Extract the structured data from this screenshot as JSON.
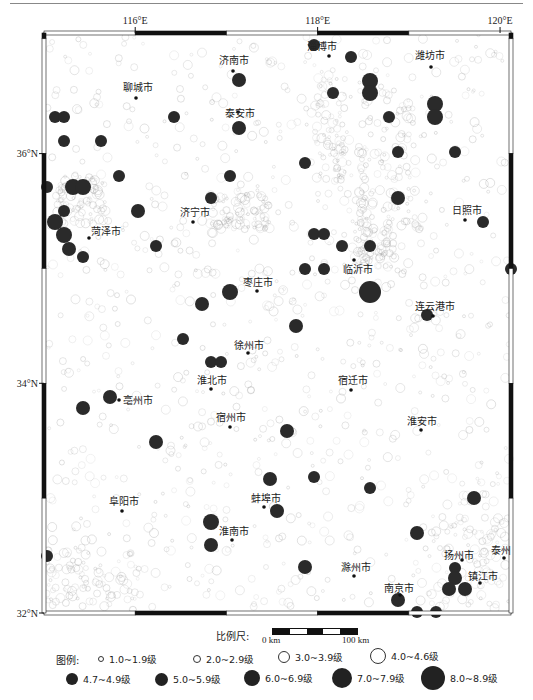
{
  "map": {
    "frame": {
      "left": 44,
      "top": 33,
      "right": 511,
      "bottom": 613
    },
    "lon_range": [
      115.0,
      120.12
    ],
    "lat_range": [
      32.0,
      37.05
    ],
    "lon_ticks": [
      {
        "label": "116°E",
        "value": 116
      },
      {
        "label": "118°E",
        "value": 118
      },
      {
        "label": "120°E",
        "value": 120
      }
    ],
    "lat_ticks": [
      {
        "label": "36°N",
        "value": 36
      },
      {
        "label": "34°N",
        "value": 34
      },
      {
        "label": "32°N",
        "value": 32
      }
    ],
    "cities": [
      {
        "name": "淄博市",
        "x": 329,
        "y": 56,
        "lx": 307,
        "ly": 50
      },
      {
        "name": "济南市",
        "x": 233,
        "y": 71,
        "lx": 219,
        "ly": 64
      },
      {
        "name": "潍坊市",
        "x": 431,
        "y": 67,
        "lx": 415,
        "ly": 59
      },
      {
        "name": "聊城市",
        "x": 136,
        "y": 98,
        "lx": 123,
        "ly": 91
      },
      {
        "name": "泰安市",
        "x": 238,
        "y": 112,
        "lx": 225,
        "ly": 117
      },
      {
        "name": "济宁市",
        "x": 193,
        "y": 222,
        "lx": 180,
        "ly": 216
      },
      {
        "name": "菏泽市",
        "x": 89,
        "y": 238,
        "lx": 91,
        "ly": 235
      },
      {
        "name": "日照市",
        "x": 465,
        "y": 220,
        "lx": 452,
        "ly": 214
      },
      {
        "name": "临沂市",
        "x": 354,
        "y": 260,
        "lx": 343,
        "ly": 273
      },
      {
        "name": "枣庄市",
        "x": 257,
        "y": 291,
        "lx": 243,
        "ly": 286
      },
      {
        "name": "连云港市",
        "x": 433,
        "y": 316,
        "lx": 415,
        "ly": 310
      },
      {
        "name": "徐州市",
        "x": 248,
        "y": 353,
        "lx": 234,
        "ly": 349
      },
      {
        "name": "淮北市",
        "x": 211,
        "y": 389,
        "lx": 197,
        "ly": 384
      },
      {
        "name": "宿迁市",
        "x": 351,
        "y": 390,
        "lx": 338,
        "ly": 384
      },
      {
        "name": "亳州市",
        "x": 119,
        "y": 400,
        "lx": 123,
        "ly": 404
      },
      {
        "name": "宿州市",
        "x": 230,
        "y": 427,
        "lx": 216,
        "ly": 421
      },
      {
        "name": "淮安市",
        "x": 421,
        "y": 430,
        "lx": 407,
        "ly": 425
      },
      {
        "name": "阜阳市",
        "x": 122,
        "y": 511,
        "lx": 109,
        "ly": 505
      },
      {
        "name": "蚌埠市",
        "x": 264,
        "y": 507,
        "lx": 251,
        "ly": 502
      },
      {
        "name": "淮南市",
        "x": 232,
        "y": 540,
        "lx": 219,
        "ly": 535
      },
      {
        "name": "滁州市",
        "x": 354,
        "y": 576,
        "lx": 341,
        "ly": 571
      },
      {
        "name": "扬州市",
        "x": 462,
        "y": 560,
        "lx": 444,
        "ly": 559
      },
      {
        "name": "泰州",
        "x": 504,
        "y": 558,
        "lx": 491,
        "ly": 554
      },
      {
        "name": "镇江市",
        "x": 480,
        "y": 583,
        "lx": 468,
        "ly": 580
      },
      {
        "name": "南京市",
        "x": 400,
        "y": 595,
        "lx": 384,
        "ly": 592
      }
    ],
    "major_events": [
      {
        "x": 314,
        "y": 45,
        "r": 6
      },
      {
        "x": 351,
        "y": 57,
        "r": 6
      },
      {
        "x": 370,
        "y": 81,
        "r": 8
      },
      {
        "x": 370,
        "y": 93,
        "r": 8
      },
      {
        "x": 333,
        "y": 93,
        "r": 6
      },
      {
        "x": 435,
        "y": 104,
        "r": 8
      },
      {
        "x": 435,
        "y": 117,
        "r": 8
      },
      {
        "x": 389,
        "y": 117,
        "r": 6
      },
      {
        "x": 455,
        "y": 152,
        "r": 6
      },
      {
        "x": 398,
        "y": 152,
        "r": 6
      },
      {
        "x": 398,
        "y": 198,
        "r": 7
      },
      {
        "x": 483,
        "y": 222,
        "r": 6
      },
      {
        "x": 239,
        "y": 80,
        "r": 7
      },
      {
        "x": 55,
        "y": 117,
        "r": 6
      },
      {
        "x": 64,
        "y": 117,
        "r": 6
      },
      {
        "x": 174,
        "y": 117,
        "r": 6
      },
      {
        "x": 64,
        "y": 141,
        "r": 6
      },
      {
        "x": 101,
        "y": 141,
        "r": 6
      },
      {
        "x": 239,
        "y": 128,
        "r": 7
      },
      {
        "x": 305,
        "y": 163,
        "r": 6
      },
      {
        "x": 119,
        "y": 176,
        "r": 6
      },
      {
        "x": 230,
        "y": 176,
        "r": 6
      },
      {
        "x": 73,
        "y": 187,
        "r": 8
      },
      {
        "x": 83,
        "y": 187,
        "r": 8
      },
      {
        "x": 47,
        "y": 187,
        "r": 6
      },
      {
        "x": 138,
        "y": 211,
        "r": 7
      },
      {
        "x": 211,
        "y": 198,
        "r": 6
      },
      {
        "x": 64,
        "y": 211,
        "r": 6
      },
      {
        "x": 55,
        "y": 222,
        "r": 8
      },
      {
        "x": 64,
        "y": 235,
        "r": 8
      },
      {
        "x": 69,
        "y": 249,
        "r": 7
      },
      {
        "x": 83,
        "y": 257,
        "r": 6
      },
      {
        "x": 156,
        "y": 246,
        "r": 6
      },
      {
        "x": 314,
        "y": 234,
        "r": 6
      },
      {
        "x": 324,
        "y": 234,
        "r": 6
      },
      {
        "x": 342,
        "y": 246,
        "r": 6
      },
      {
        "x": 370,
        "y": 246,
        "r": 6
      },
      {
        "x": 305,
        "y": 269,
        "r": 6
      },
      {
        "x": 324,
        "y": 269,
        "r": 6
      },
      {
        "x": 370,
        "y": 292,
        "r": 11
      },
      {
        "x": 230,
        "y": 292,
        "r": 8
      },
      {
        "x": 202,
        "y": 304,
        "r": 7
      },
      {
        "x": 427,
        "y": 315,
        "r": 6
      },
      {
        "x": 296,
        "y": 326,
        "r": 7
      },
      {
        "x": 511,
        "y": 269,
        "r": 6
      },
      {
        "x": 183,
        "y": 339,
        "r": 6
      },
      {
        "x": 211,
        "y": 362,
        "r": 6
      },
      {
        "x": 221,
        "y": 362,
        "r": 6
      },
      {
        "x": 110,
        "y": 397,
        "r": 7
      },
      {
        "x": 83,
        "y": 408,
        "r": 7
      },
      {
        "x": 156,
        "y": 442,
        "r": 7
      },
      {
        "x": 287,
        "y": 431,
        "r": 7
      },
      {
        "x": 270,
        "y": 479,
        "r": 7
      },
      {
        "x": 314,
        "y": 477,
        "r": 6
      },
      {
        "x": 370,
        "y": 488,
        "r": 6
      },
      {
        "x": 474,
        "y": 498,
        "r": 7
      },
      {
        "x": 277,
        "y": 511,
        "r": 7
      },
      {
        "x": 211,
        "y": 522,
        "r": 8
      },
      {
        "x": 211,
        "y": 545,
        "r": 7
      },
      {
        "x": 305,
        "y": 567,
        "r": 7
      },
      {
        "x": 417,
        "y": 533,
        "r": 7
      },
      {
        "x": 455,
        "y": 568,
        "r": 6
      },
      {
        "x": 455,
        "y": 578,
        "r": 7
      },
      {
        "x": 449,
        "y": 589,
        "r": 7
      },
      {
        "x": 465,
        "y": 589,
        "r": 7
      },
      {
        "x": 398,
        "y": 600,
        "r": 7
      },
      {
        "x": 417,
        "y": 612,
        "r": 6
      },
      {
        "x": 436,
        "y": 612,
        "r": 6
      },
      {
        "x": 47,
        "y": 556,
        "r": 6
      }
    ]
  },
  "scale": {
    "title": "比例尺:",
    "start": "0 km",
    "end": "100 km"
  },
  "legend": {
    "title": "图例:",
    "items": [
      {
        "label": "1.0~1.9级",
        "type": "open",
        "size": 4,
        "x": 98,
        "y": 30
      },
      {
        "label": "2.0~2.9级",
        "type": "open",
        "size": 6,
        "x": 193,
        "y": 30
      },
      {
        "label": "3.0~3.9级",
        "type": "open",
        "size": 10,
        "x": 278,
        "y": 28
      },
      {
        "label": "4.0~4.6级",
        "type": "open",
        "size": 14,
        "x": 370,
        "y": 26
      },
      {
        "label": "4.7~4.9级",
        "type": "fill",
        "size": 12,
        "x": 66,
        "y": 50
      },
      {
        "label": "5.0~5.9级",
        "type": "fill",
        "size": 13,
        "x": 155,
        "y": 50
      },
      {
        "label": "6.0~6.9级",
        "type": "fill",
        "size": 16,
        "x": 244,
        "y": 48
      },
      {
        "label": "7.0~7.9级",
        "type": "fill",
        "size": 20,
        "x": 332,
        "y": 46
      },
      {
        "label": "8.0~8.9级",
        "type": "fill",
        "size": 24,
        "x": 421,
        "y": 44
      }
    ]
  }
}
